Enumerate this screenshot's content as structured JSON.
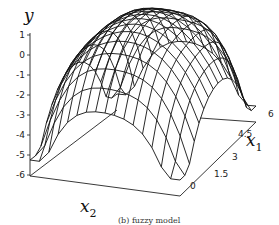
{
  "chart_data": {
    "type": "surface",
    "title": "",
    "caption": "(b) fuzzy model",
    "xlabel": "x2",
    "ylabel": "x1",
    "zlabel": "y",
    "z_ticks": [
      "1",
      "0",
      "-1",
      "-2",
      "-3",
      "-4",
      "-5",
      "-6"
    ],
    "zlim": [
      -6,
      1
    ],
    "x1_ticks": [
      "0",
      "1.5",
      "3",
      "4.5",
      "6"
    ],
    "x1_range": [
      0,
      6
    ],
    "x2_range": [
      0,
      6
    ],
    "grid": "wireframe",
    "mesh_resolution": [
      16,
      16
    ]
  },
  "axes": {
    "z_label": "y",
    "x1_label": "x",
    "x1_sub": "1",
    "x2_label": "x",
    "x2_sub": "2"
  }
}
